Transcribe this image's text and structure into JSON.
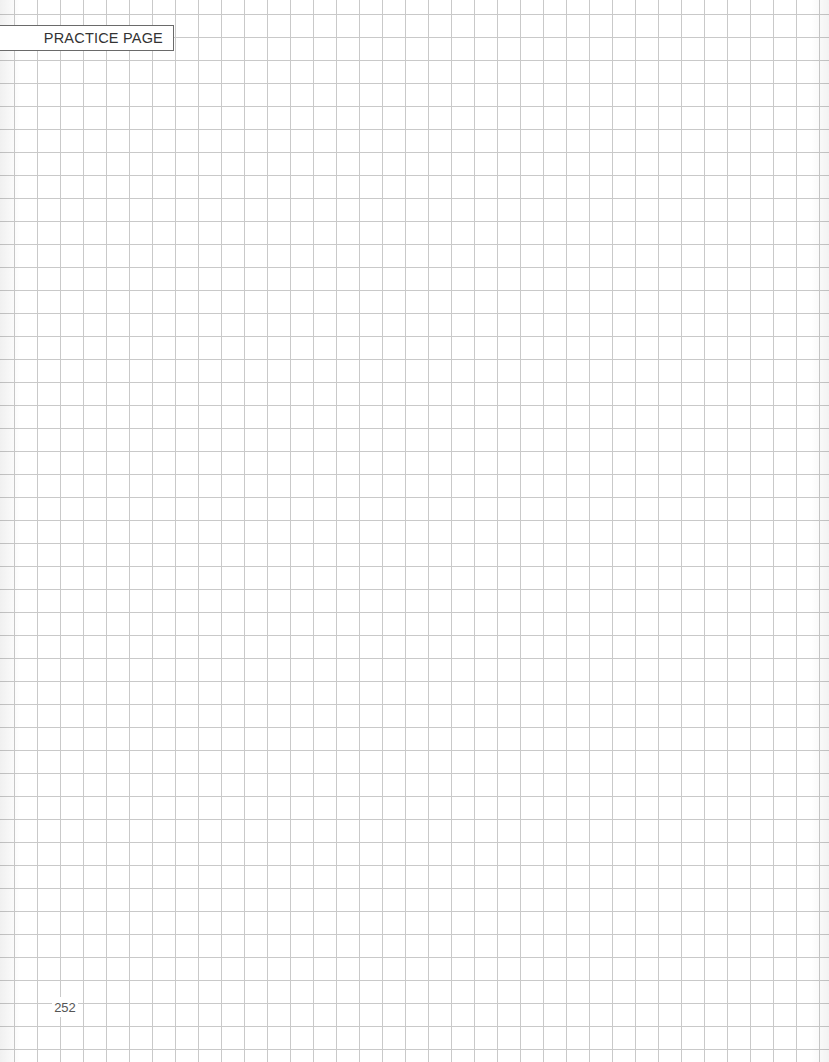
{
  "header": {
    "label": "PRACTICE PAGE"
  },
  "footer": {
    "page_number": "252"
  },
  "grid": {
    "cell_size_px": 23,
    "line_color": "#c9c9c9",
    "background_color": "#ffffff"
  },
  "colors": {
    "label_border": "#6a6a6a",
    "label_text": "#333333",
    "page_number_text": "#555555"
  }
}
